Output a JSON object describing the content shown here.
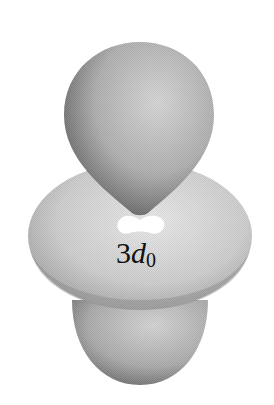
{
  "figure": {
    "label": {
      "prefix": "3",
      "letter": "d",
      "subscript": "0"
    },
    "colors": {
      "background": "#ffffff",
      "lobe_light": "#d4d4d4",
      "lobe_dark": "#6a6a6a",
      "torus_light": "#e6e6e6",
      "torus_dark": "#9a9a9a",
      "text": "#111111"
    }
  }
}
